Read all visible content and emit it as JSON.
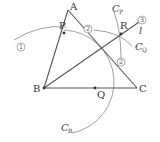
{
  "points": {
    "A": {
      "label": "A",
      "x": 68,
      "y": 10
    },
    "B": {
      "label": "B",
      "x": 44,
      "y": 88
    },
    "C": {
      "label": "C",
      "x": 137,
      "y": 88
    },
    "P": {
      "label": "P",
      "x": 64,
      "y": 33
    },
    "Q": {
      "label": "Q",
      "x": 95,
      "y": 88
    },
    "R": {
      "label": "R",
      "x": 121,
      "y": 34
    }
  },
  "line_l": {
    "label": "l"
  },
  "arcs": {
    "CB": {
      "main": "C",
      "sub": "B"
    },
    "CP": {
      "main": "C",
      "sub": "P"
    },
    "CQ": {
      "main": "C",
      "sub": "Q"
    }
  },
  "step_markers": {
    "step1": "1",
    "step2a": "2",
    "step2b": "2",
    "step3": "3"
  }
}
